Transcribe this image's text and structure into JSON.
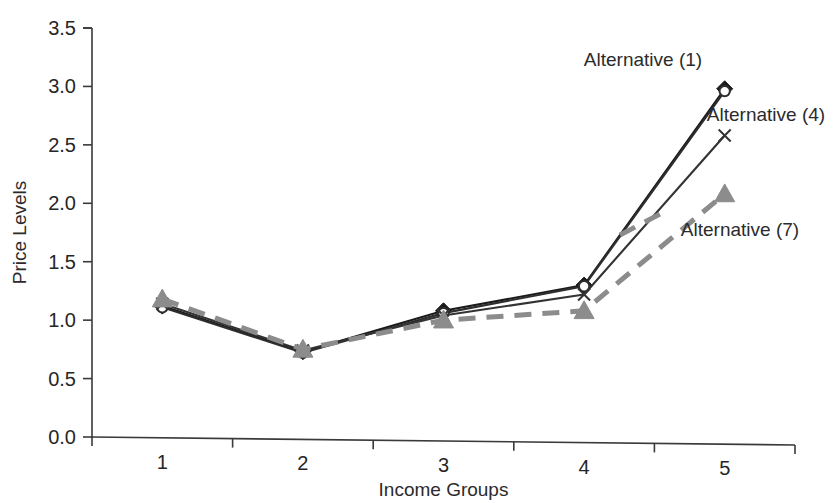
{
  "chart_data": {
    "type": "line",
    "title": "",
    "xlabel": "Income Groups",
    "ylabel": "Price Levels",
    "categories": [
      "1",
      "2",
      "3",
      "4",
      "5"
    ],
    "x": [
      1,
      2,
      3,
      4,
      5
    ],
    "ylim": [
      0.0,
      3.5
    ],
    "ytick_labels": [
      "0.0",
      "0.5",
      "1.0",
      "1.5",
      "2.0",
      "2.5",
      "3.0",
      "3.5"
    ],
    "ytick_values": [
      0.0,
      0.5,
      1.0,
      1.5,
      2.0,
      2.5,
      3.0,
      3.5
    ],
    "xtick_labels": [
      "1",
      "2",
      "3",
      "4",
      "5"
    ],
    "grid": false,
    "legend_position": "inline-annotations",
    "series": [
      {
        "name": "Alternative (1)",
        "marker": "diamond",
        "linestyle": "solid",
        "color": "#1a1a1a",
        "values": [
          1.12,
          0.73,
          1.08,
          1.3,
          2.98
        ]
      },
      {
        "name": "Alternative (2)",
        "marker": "circle-open",
        "linestyle": "solid",
        "color": "#2e2e2e",
        "values": [
          1.11,
          0.72,
          1.06,
          1.29,
          2.96
        ]
      },
      {
        "name": "Alternative (4)",
        "marker": "cross",
        "linestyle": "solid",
        "color": "#333333",
        "values": [
          1.14,
          0.74,
          1.04,
          1.22,
          2.58
        ]
      },
      {
        "name": "Alternative (7)",
        "marker": "triangle",
        "linestyle": "dashed",
        "color": "#8c8c8c",
        "values": [
          1.18,
          0.75,
          1.0,
          1.08,
          2.08
        ]
      }
    ],
    "annotations": [
      {
        "text": "Alternative (1)",
        "target_series": "Alternative (1)"
      },
      {
        "text": "Alternative (4)",
        "target_series": "Alternative (4)"
      },
      {
        "text": "Alternative (7)",
        "target_series": "Alternative (7)"
      }
    ]
  }
}
